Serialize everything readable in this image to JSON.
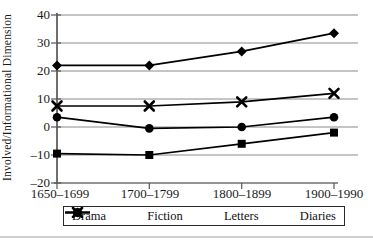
{
  "figure": {
    "y_axis_label": "Involved/Informational Dimension",
    "colors": {
      "data_line": "#000000",
      "gridline": "#8a8a8a",
      "axis": "#6f6f6f",
      "tick": "#555555",
      "text": "#1b1b1b",
      "legend_border": "#2a2a2a",
      "bottom_rule": "#cfcfcf"
    }
  },
  "chart_data": {
    "type": "line",
    "title": "",
    "xlabel": "",
    "ylabel": "Involved/Informational Dimension",
    "categories": [
      "1650–1699",
      "1700–1799",
      "1800–1899",
      "1900–1990"
    ],
    "series": [
      {
        "name": "Drama",
        "marker": "diamond",
        "values": [
          22,
          22,
          27,
          33.5
        ]
      },
      {
        "name": "Fiction",
        "marker": "circle",
        "values": [
          3.5,
          -0.5,
          0,
          3.5
        ]
      },
      {
        "name": "Letters",
        "marker": "x-cross",
        "values": [
          7.5,
          7.5,
          9,
          12
        ]
      },
      {
        "name": "Diaries",
        "marker": "square",
        "values": [
          -9.5,
          -10,
          -6,
          -2
        ]
      }
    ],
    "ylim": [
      -20,
      40
    ],
    "y_ticks": [
      "40",
      "30",
      "20",
      "10",
      "0",
      "–10",
      "–20"
    ],
    "y_tick_values": [
      40,
      30,
      20,
      10,
      0,
      -10,
      -20
    ],
    "grid": true,
    "legend_position": "bottom"
  }
}
